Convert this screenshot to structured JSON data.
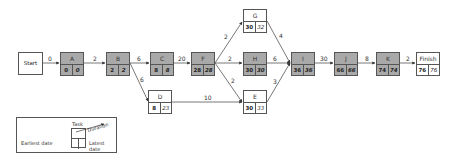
{
  "diagram": {
    "type": "activity-on-node network (critical path)",
    "start": {
      "label": "Start"
    },
    "finish": {
      "label": "Finish",
      "earliest": "76",
      "latest": "76"
    },
    "nodes": [
      {
        "id": "A",
        "label": "A",
        "earliest": "0",
        "latest": "0",
        "critical": true
      },
      {
        "id": "B",
        "label": "B",
        "earliest": "2",
        "latest": "2",
        "critical": true
      },
      {
        "id": "C",
        "label": "C",
        "earliest": "8",
        "latest": "8",
        "critical": true
      },
      {
        "id": "F",
        "label": "F",
        "earliest": "28",
        "latest": "28",
        "critical": true
      },
      {
        "id": "D",
        "label": "D",
        "earliest": "8",
        "latest": "23",
        "critical": false
      },
      {
        "id": "G",
        "label": "G",
        "earliest": "30",
        "latest": "32",
        "critical": false
      },
      {
        "id": "H",
        "label": "H",
        "earliest": "30",
        "latest": "30",
        "critical": true
      },
      {
        "id": "E",
        "label": "E",
        "earliest": "30",
        "latest": "33",
        "critical": false
      },
      {
        "id": "I",
        "label": "I",
        "earliest": "36",
        "latest": "36",
        "critical": true
      },
      {
        "id": "J",
        "label": "J",
        "earliest": "66",
        "latest": "66",
        "critical": true
      },
      {
        "id": "K",
        "label": "K",
        "earliest": "74",
        "latest": "74",
        "critical": true
      }
    ],
    "edges": [
      {
        "from": "Start",
        "to": "A",
        "duration": "0"
      },
      {
        "from": "A",
        "to": "B",
        "duration": "2"
      },
      {
        "from": "B",
        "to": "C",
        "duration": "6"
      },
      {
        "from": "B",
        "to": "D",
        "duration": "6"
      },
      {
        "from": "C",
        "to": "F",
        "duration": "20"
      },
      {
        "from": "F",
        "to": "G",
        "duration": "2"
      },
      {
        "from": "F",
        "to": "H",
        "duration": "2"
      },
      {
        "from": "F",
        "to": "E",
        "duration": "2"
      },
      {
        "from": "D",
        "to": "E",
        "duration": "10"
      },
      {
        "from": "G",
        "to": "I",
        "duration": "4"
      },
      {
        "from": "H",
        "to": "I",
        "duration": "6"
      },
      {
        "from": "E",
        "to": "I",
        "duration": "3"
      },
      {
        "from": "I",
        "to": "J",
        "duration": "30"
      },
      {
        "from": "J",
        "to": "K",
        "duration": "8"
      },
      {
        "from": "K",
        "to": "Finish",
        "duration": "2"
      }
    ],
    "colors": {
      "critical_fill": "#a9a9a9",
      "normal_fill": "#ffffff",
      "line": "#555555"
    }
  },
  "legend": {
    "task_label": "Task",
    "duration_label": "Duration",
    "earliest_label": "Earliest date",
    "latest_label": "Latest date"
  }
}
